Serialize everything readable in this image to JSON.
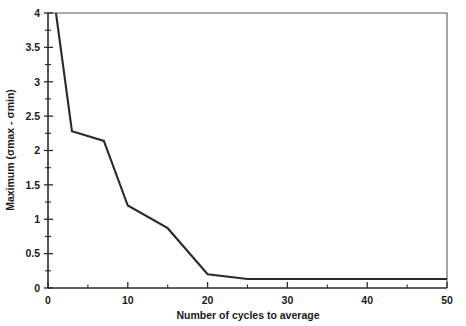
{
  "chart_data": {
    "type": "line",
    "title": "",
    "xlabel": "Number of cycles to average",
    "ylabel": "Maximum (σmax - σmin)",
    "xlim": [
      0,
      50
    ],
    "ylim": [
      0,
      4
    ],
    "grid": false,
    "legend": null,
    "x_ticks": [
      0,
      10,
      20,
      30,
      40,
      50
    ],
    "x_tick_labels": [
      "0",
      "10",
      "20",
      "30",
      "40",
      "50"
    ],
    "x_minor_ticks": [
      5,
      15,
      25,
      35,
      45
    ],
    "y_ticks": [
      0,
      0.5,
      1,
      1.5,
      2,
      2.5,
      3,
      3.5,
      4
    ],
    "y_tick_labels": [
      "0",
      "0.5",
      "1",
      "1.5",
      "2",
      "2.5",
      "3",
      "3.5",
      "4"
    ],
    "y_minor_ticks": [
      0.25,
      0.75,
      1.25,
      1.75,
      2.25,
      2.75,
      3.25,
      3.75
    ],
    "series": [
      {
        "name": "maximum-range",
        "x": [
          1,
          3,
          7,
          10,
          15,
          20,
          25,
          50
        ],
        "values": [
          4.0,
          2.28,
          2.14,
          1.2,
          0.87,
          0.2,
          0.13,
          0.13
        ]
      }
    ]
  },
  "axes": {
    "x_axis_title": "Number of cycles to average",
    "y_axis_title": "Maximum (σmax - σmin)"
  },
  "colors": {
    "series": "#2a2a2a",
    "axis": "#2b2b2b",
    "frame": "#555b5e",
    "background": "#ffffff"
  }
}
